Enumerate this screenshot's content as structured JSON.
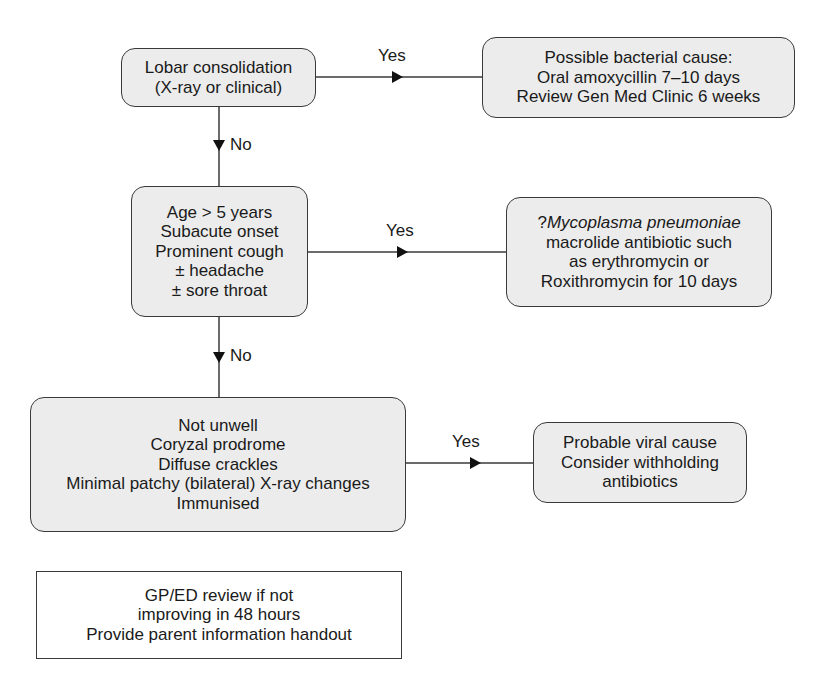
{
  "flowchart": {
    "nodes": [
      {
        "id": "lobar",
        "lines": [
          "Lobar consolidation",
          "(X-ray or clinical)"
        ]
      },
      {
        "id": "bacterial",
        "lines": [
          "Possible bacterial cause:",
          "Oral amoxycillin 7–10 days",
          "Review Gen Med Clinic 6 weeks"
        ]
      },
      {
        "id": "mycoplasma-criteria",
        "lines": [
          "Age > 5 years",
          "Subacute onset",
          "Prominent cough",
          "± headache",
          "± sore throat"
        ]
      },
      {
        "id": "mycoplasma",
        "prefix": "?",
        "italic": "Mycoplasma pneumoniae",
        "lines": [
          "macrolide antibiotic such",
          "as erythromycin or",
          "Roxithromycin for 10 days"
        ]
      },
      {
        "id": "viral-criteria",
        "lines": [
          "Not unwell",
          "Coryzal prodrome",
          "Diffuse crackles",
          "Minimal patchy (bilateral) X-ray changes",
          "Immunised"
        ]
      },
      {
        "id": "viral",
        "lines": [
          "Probable viral cause",
          "Consider withholding",
          "antibiotics"
        ]
      },
      {
        "id": "followup",
        "lines": [
          "GP/ED review if not",
          "improving in 48 hours",
          "Provide parent information handout"
        ]
      }
    ],
    "edges": [
      {
        "from": "lobar",
        "to": "bacterial",
        "label": "Yes"
      },
      {
        "from": "lobar",
        "to": "mycoplasma-criteria",
        "label": "No"
      },
      {
        "from": "mycoplasma-criteria",
        "to": "mycoplasma",
        "label": "Yes"
      },
      {
        "from": "mycoplasma-criteria",
        "to": "viral-criteria",
        "label": "No"
      },
      {
        "from": "viral-criteria",
        "to": "viral",
        "label": "Yes"
      }
    ]
  },
  "colors": {
    "box_fill": "#ececec",
    "stroke": "#3a3a3a",
    "text": "#1a1a1a"
  }
}
